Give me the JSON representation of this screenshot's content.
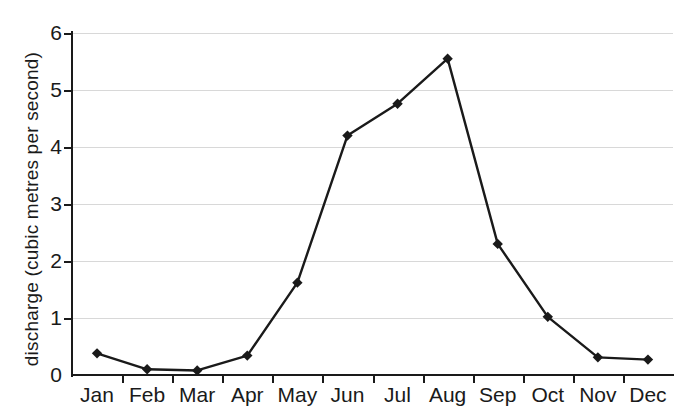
{
  "chart_data": {
    "type": "line",
    "title": "",
    "xlabel": "",
    "ylabel": "discharge (cubic metres per second)",
    "categories": [
      "Jan",
      "Feb",
      "Mar",
      "Apr",
      "May",
      "Jun",
      "Jul",
      "Aug",
      "Sep",
      "Oct",
      "Nov",
      "Dec"
    ],
    "values": [
      0.38,
      0.1,
      0.08,
      0.34,
      1.62,
      4.2,
      4.76,
      5.55,
      2.3,
      1.02,
      0.31,
      0.27
    ],
    "series": [
      {
        "name": "discharge",
        "values": [
          0.38,
          0.1,
          0.08,
          0.34,
          1.62,
          4.2,
          4.76,
          5.55,
          2.3,
          1.02,
          0.31,
          0.27
        ]
      }
    ],
    "ylim": [
      0,
      6
    ],
    "yticks": [
      0,
      1,
      2,
      3,
      4,
      5,
      6
    ],
    "ytick_labels": [
      "0",
      "1",
      "2",
      "3",
      "4",
      "5",
      "6"
    ],
    "grid": true,
    "legend": false,
    "marker": "diamond",
    "line_color": "#1a1a1a",
    "marker_color": "#1a1a1a",
    "grid_color": "#d8d8d8",
    "background": "#ffffff"
  }
}
